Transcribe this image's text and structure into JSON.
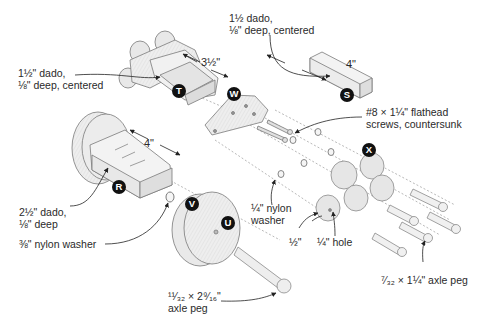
{
  "diagram": {
    "type": "exploded-assembly",
    "parts": [
      {
        "id": "T",
        "description": "front body block with stacked wheels"
      },
      {
        "id": "W",
        "description": "triangular connector plate"
      },
      {
        "id": "S",
        "description": "small rectangular block"
      },
      {
        "id": "R",
        "description": "rear body block with large wheel"
      },
      {
        "id": "V",
        "description": "large wheel"
      },
      {
        "id": "U",
        "description": "wheel axle hole"
      },
      {
        "id": "X",
        "description": "small wheels"
      }
    ],
    "dimensions": {
      "t_length": "3½\"",
      "s_length": "4\"",
      "r_length": "4\""
    },
    "labels": {
      "t_dado_line1": "1½\" dado,",
      "t_dado_line2": "⅛\" deep, centered",
      "s_dado_line1": "1½ dado,",
      "s_dado_line2": "⅛\" deep, centered",
      "screws_line1": "#8 × 1¼\" flathead",
      "screws_line2": "screws, countersunk",
      "r_dado_line1": "2½\" dado,",
      "r_dado_line2": "⅛\" deep",
      "big_washer": "⅜\" nylon washer",
      "small_washer_line1": "¼\" nylon",
      "small_washer_line2": "washer",
      "half_inch": "½\"",
      "quarter_hole": "¼\" hole",
      "long_peg_line1": "¹¹⁄₃₂ × 2⁹⁄₁₆\"",
      "long_peg_line2": "axle peg",
      "short_peg": "⁷⁄₃₂ × 1¼\" axle peg"
    },
    "badges": {
      "t": "T",
      "w": "W",
      "s": "S",
      "r": "R",
      "v": "V",
      "u": "U",
      "x": "X"
    },
    "colors": {
      "wood": "#ececec",
      "wood_shade": "#d6d6d6",
      "outline": "#7a7a7a",
      "badge": "#111111",
      "leader": "#2a2a2a"
    }
  }
}
